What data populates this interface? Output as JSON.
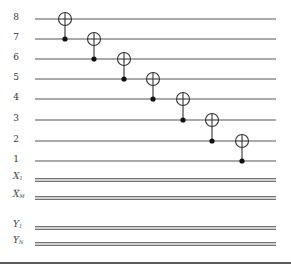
{
  "diagram": {
    "type": "quantum-circuit",
    "colors": {
      "wire": "#555555",
      "classical_wire": "#444444",
      "gate": "#333333",
      "label": "#333333",
      "background": "#ffffff"
    },
    "qubits": [
      {
        "label": "8",
        "y": 19
      },
      {
        "label": "7",
        "y": 39
      },
      {
        "label": "6",
        "y": 59
      },
      {
        "label": "5",
        "y": 79
      },
      {
        "label": "4",
        "y": 99
      },
      {
        "label": "3",
        "y": 120
      },
      {
        "label": "2",
        "y": 141
      },
      {
        "label": "1",
        "y": 161
      }
    ],
    "wire_x_start": 35,
    "wire_x_end": 276,
    "classical_registers": [
      {
        "name": "X",
        "first_label": "X",
        "first_sub": "1",
        "last_label": "X",
        "last_sub": "M",
        "ellipsis": "...",
        "y_first": 180,
        "y_last": 198
      },
      {
        "name": "Y",
        "first_label": "Y",
        "first_sub": "1",
        "last_label": "Y",
        "last_sub": "N",
        "ellipsis": "...",
        "y_first": 228,
        "y_last": 244
      }
    ],
    "gates": [
      {
        "type": "CNOT",
        "x": 65,
        "target": "8",
        "control": "7"
      },
      {
        "type": "CNOT",
        "x": 94,
        "target": "7",
        "control": "6"
      },
      {
        "type": "CNOT",
        "x": 124,
        "target": "6",
        "control": "5"
      },
      {
        "type": "CNOT",
        "x": 153,
        "target": "5",
        "control": "4"
      },
      {
        "type": "CNOT",
        "x": 183,
        "target": "4",
        "control": "3"
      },
      {
        "type": "CNOT",
        "x": 212,
        "target": "3",
        "control": "2"
      },
      {
        "type": "CNOT",
        "x": 242,
        "target": "2",
        "control": "1"
      }
    ],
    "bottom_rule_y": 263
  }
}
